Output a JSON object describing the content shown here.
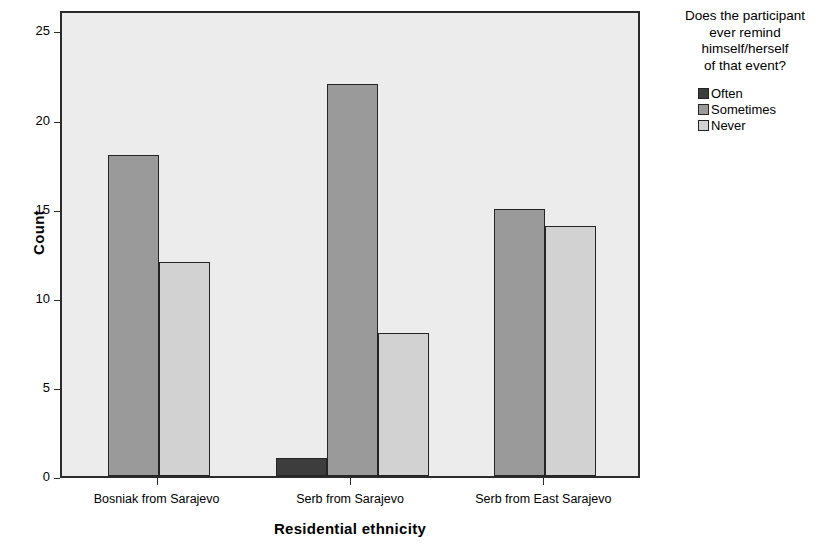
{
  "chart_data": {
    "type": "bar",
    "title": "",
    "xlabel": "Residential ethnicity",
    "ylabel": "Count",
    "categories": [
      "Bosniak from Sarajevo",
      "Serb from Sarajevo",
      "Serb from East Sarajevo"
    ],
    "series": [
      {
        "name": "Often",
        "values": [
          0,
          1,
          0
        ],
        "color": "#3d3d3d"
      },
      {
        "name": "Sometimes",
        "values": [
          18,
          22,
          15
        ],
        "color": "#9a9a9a"
      },
      {
        "name": "Never",
        "values": [
          12,
          8,
          14
        ],
        "color": "#d2d2d2"
      }
    ],
    "ylim": [
      0,
      26.2
    ],
    "yticks": [
      0,
      5,
      10,
      15,
      20,
      25
    ],
    "ytick_labels": [
      "0",
      "5",
      "10",
      "15",
      "20",
      "25"
    ],
    "grid": false,
    "legend": {
      "position": "right",
      "title": "Does the participant ever remind himself/herself of that event?",
      "title_lines": [
        "Does the participant",
        "ever remind",
        "himself/herself",
        "of that event?"
      ],
      "entries": [
        "Often",
        "Sometimes",
        "Never"
      ]
    },
    "plot_background": "#ececec",
    "frame_color": "#2b2b2b"
  }
}
